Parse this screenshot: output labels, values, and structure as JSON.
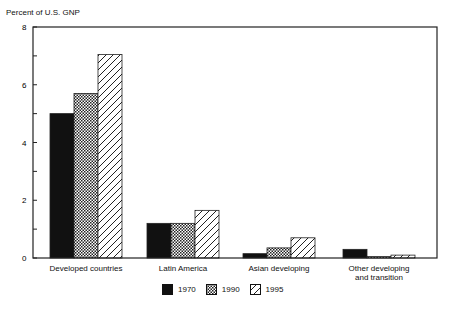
{
  "chart_data": {
    "type": "bar",
    "title": "",
    "ylabel": "Percent of U.S. GNP",
    "xlabel": "",
    "ylim": [
      0,
      8
    ],
    "yticks": [
      0,
      2,
      4,
      6,
      8
    ],
    "grid": false,
    "legend_position": "bottom",
    "categories": [
      "Developed countries",
      "Latin America",
      "Asian developing",
      "Other developing and transition"
    ],
    "series": [
      {
        "name": "1970",
        "pattern": "solid",
        "values": [
          5.0,
          1.2,
          0.15,
          0.3
        ]
      },
      {
        "name": "1990",
        "pattern": "crosshatch",
        "values": [
          5.7,
          1.2,
          0.35,
          0.05
        ]
      },
      {
        "name": "1995",
        "pattern": "diagonal",
        "values": [
          7.05,
          1.65,
          0.7,
          0.1
        ]
      }
    ]
  },
  "labels": {
    "y_title": "Percent of U.S. GNP",
    "categories": [
      "Developed countries",
      "Latin America",
      "Asian developing",
      "Other developing"
    ],
    "category_line2": [
      "",
      "",
      "",
      "and transition"
    ],
    "legend": [
      "1970",
      "1990",
      "1995"
    ],
    "yticks": [
      "0",
      "2",
      "4",
      "6",
      "8"
    ]
  }
}
